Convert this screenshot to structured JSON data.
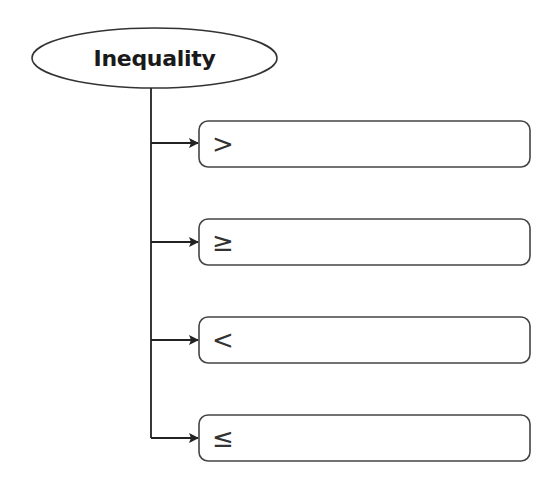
{
  "diagram": {
    "root": {
      "label": "Inequality"
    },
    "branches": [
      {
        "symbol": ">",
        "text": ""
      },
      {
        "symbol": "≥",
        "text": ""
      },
      {
        "symbol": "<",
        "text": ""
      },
      {
        "symbol": "≤",
        "text": ""
      }
    ]
  },
  "colors": {
    "stroke": "#333333",
    "text": "#1a1a1a",
    "background": "#ffffff"
  }
}
